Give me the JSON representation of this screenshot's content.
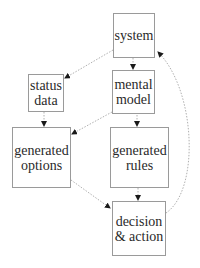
{
  "diagram": {
    "nodes": [
      {
        "id": "system",
        "label": "system"
      },
      {
        "id": "status-data",
        "label": "status\ndata"
      },
      {
        "id": "mental-model",
        "label": "mental\nmodel"
      },
      {
        "id": "generated-options",
        "label": "generated\noptions"
      },
      {
        "id": "generated-rules",
        "label": "generated\nrules"
      },
      {
        "id": "decision-action",
        "label": "decision\n& action"
      }
    ],
    "edges": [
      {
        "from": "system",
        "to": "status-data",
        "style": "dotted"
      },
      {
        "from": "system",
        "to": "mental-model",
        "style": "dotted"
      },
      {
        "from": "status-data",
        "to": "generated-options",
        "style": "dotted"
      },
      {
        "from": "mental-model",
        "to": "generated-options",
        "style": "dotted"
      },
      {
        "from": "mental-model",
        "to": "generated-rules",
        "style": "dotted"
      },
      {
        "from": "generated-options",
        "to": "decision-action",
        "style": "dotted"
      },
      {
        "from": "generated-rules",
        "to": "decision-action",
        "style": "dotted"
      },
      {
        "from": "decision-action",
        "to": "system",
        "style": "dotted"
      }
    ],
    "colors": {
      "border": "#9a9a9a",
      "edge": "#b0b0b0",
      "arrow": "#1a1a1a",
      "text": "#2a2a2a"
    }
  }
}
